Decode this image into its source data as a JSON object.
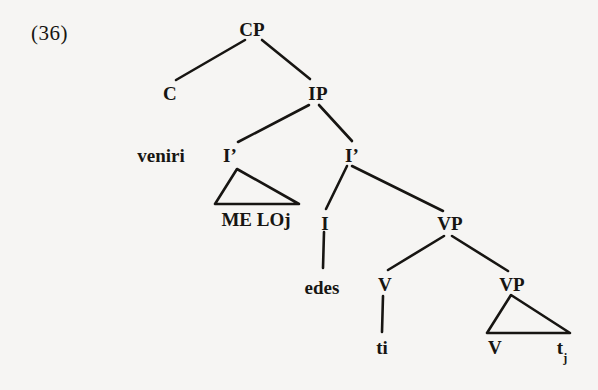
{
  "figure": {
    "example_number": "(36)",
    "type": "syntactic-tree",
    "background_color": "#f6f5f3",
    "line_color": "#171512"
  },
  "nodes": {
    "cp": {
      "label": "CP",
      "x": 252,
      "y": 20
    },
    "c": {
      "label": "C",
      "x": 170,
      "y": 84
    },
    "ip": {
      "label": "IP",
      "x": 318,
      "y": 84
    },
    "ibar_left": {
      "label": "I’",
      "x": 230,
      "y": 146
    },
    "ibar_right": {
      "label": "I’",
      "x": 352,
      "y": 146
    },
    "i_head": {
      "label": "I",
      "x": 325,
      "y": 214
    },
    "vp_upper": {
      "label": "VP",
      "x": 450,
      "y": 214
    },
    "v_left": {
      "label": "V",
      "x": 385,
      "y": 275
    },
    "vp_lower": {
      "label": "VP",
      "x": 512,
      "y": 275
    },
    "v_triangle": {
      "label": "V",
      "x": 495,
      "y": 338
    },
    "t_j_triangle": {
      "label": "t",
      "sub": "j",
      "x": 562,
      "y": 338
    }
  },
  "leaves": {
    "venir": {
      "label": "venir",
      "sub": "i",
      "x": 161,
      "y": 146
    },
    "me_lo": {
      "label": "ME LO",
      "sub": "j",
      "x": 256,
      "y": 210
    },
    "edes": {
      "label": "edes",
      "x": 322,
      "y": 278
    },
    "t_i": {
      "label": "t",
      "sub": "i",
      "x": 382,
      "y": 338
    }
  },
  "edges": [
    {
      "name": "cp-to-c",
      "x1": 245,
      "y1": 40,
      "x2": 176,
      "y2": 80
    },
    {
      "name": "cp-to-ip",
      "x1": 262,
      "y1": 40,
      "x2": 310,
      "y2": 79
    },
    {
      "name": "ip-to-ibar-left",
      "x1": 309,
      "y1": 105,
      "x2": 238,
      "y2": 142
    },
    {
      "name": "ip-to-ibar-right",
      "x1": 319,
      "y1": 105,
      "x2": 352,
      "y2": 141
    },
    {
      "name": "ibar-right-to-i",
      "x1": 347,
      "y1": 166,
      "x2": 326,
      "y2": 209
    },
    {
      "name": "ibar-right-to-vp",
      "x1": 352,
      "y1": 166,
      "x2": 443,
      "y2": 211
    },
    {
      "name": "i-to-edes",
      "x1": 324,
      "y1": 232,
      "x2": 323,
      "y2": 268
    },
    {
      "name": "vp-to-v",
      "x1": 444,
      "y1": 236,
      "x2": 388,
      "y2": 270
    },
    {
      "name": "vp-to-vp-lower",
      "x1": 452,
      "y1": 236,
      "x2": 508,
      "y2": 271
    },
    {
      "name": "v-to-t-i",
      "x1": 383,
      "y1": 296,
      "x2": 382,
      "y2": 332
    }
  ],
  "triangles": [
    {
      "name": "me-lo-triangle",
      "apex_x": 237,
      "apex_y": 169,
      "base_left_x": 215,
      "base_right_x": 299,
      "base_y": 204
    },
    {
      "name": "vp-lower-triangle",
      "apex_x": 511,
      "apex_y": 295,
      "base_left_x": 487,
      "base_right_x": 570,
      "base_y": 333
    }
  ]
}
